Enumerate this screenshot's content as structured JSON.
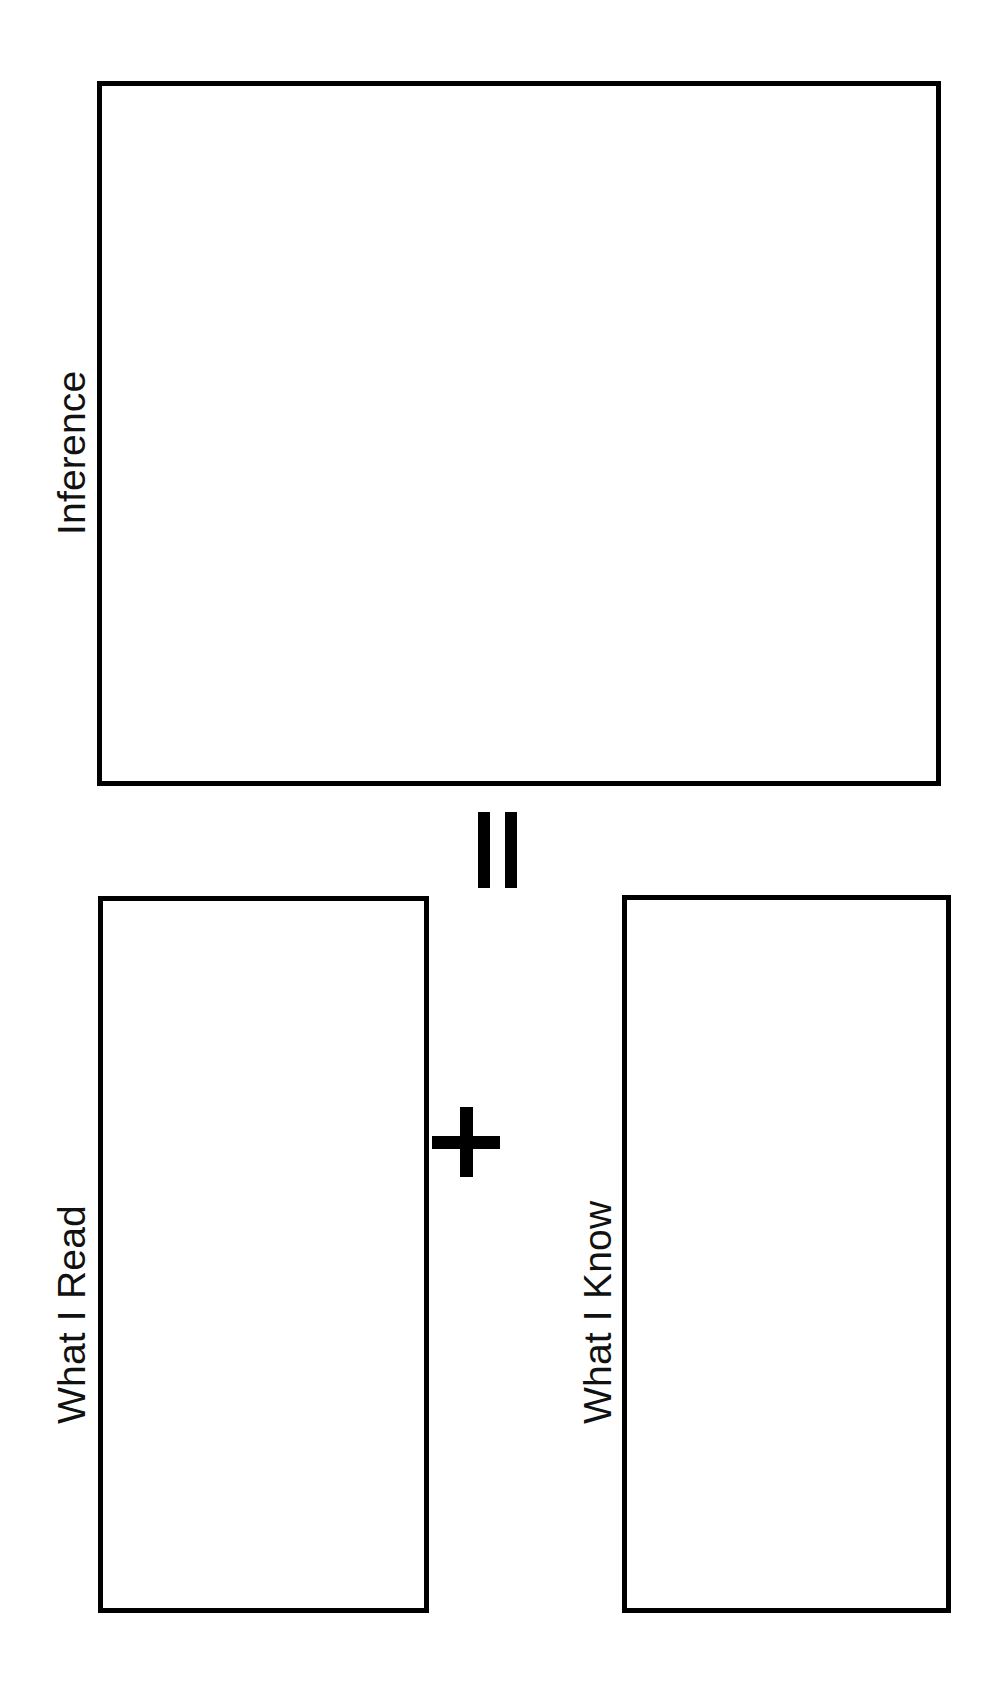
{
  "page": {
    "orientation": "landscape-rotated-90-ccw",
    "background_color": "#ffffff",
    "ink_color": "#000000"
  },
  "organizer": {
    "result": {
      "label": "Inference",
      "box_content": ""
    },
    "operands": [
      {
        "label": "What I Read",
        "box_content": ""
      },
      {
        "label": "What I Know",
        "box_content": ""
      }
    ],
    "operators": {
      "plus": "+",
      "equals": "="
    }
  }
}
